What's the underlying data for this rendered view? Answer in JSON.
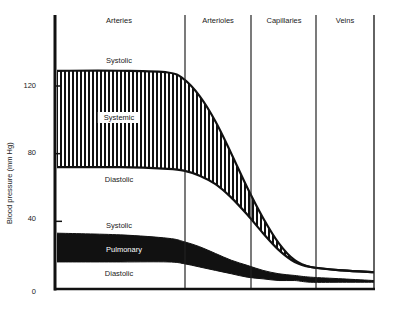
{
  "chart_data": {
    "type": "area",
    "title": "",
    "xlabel": "",
    "ylabel": "Blood pressure (mm Hg)",
    "ylim": [
      0,
      150
    ],
    "yticks": [
      0,
      40,
      80,
      120
    ],
    "grid": false,
    "legend": null,
    "regions": [
      "Arteries",
      "Arterioles",
      "Capillaries",
      "Veins"
    ],
    "x": [
      0,
      0.2,
      0.35,
      0.4,
      0.45,
      0.5,
      0.55,
      0.6,
      0.65,
      0.7,
      0.75,
      0.8,
      0.9,
      1.0
    ],
    "series": [
      {
        "name": "Systemic",
        "fill": "vertical-hatch",
        "upper_label": "Systolic",
        "lower_label": "Diastolic",
        "upper": [
          129,
          129,
          128,
          124,
          114,
          99,
          80,
          60,
          42,
          27,
          17,
          13,
          11,
          10
        ],
        "lower": [
          72,
          72,
          71,
          70,
          67,
          62,
          54,
          44,
          33,
          23,
          16,
          13,
          11,
          10
        ]
      },
      {
        "name": "Pulmonary",
        "fill": "solid-black",
        "upper_label": "Systolic",
        "lower_label": "Diastolic",
        "upper": [
          33,
          32,
          30,
          28,
          25,
          21,
          17,
          14,
          11,
          9,
          8,
          7,
          6,
          5
        ],
        "lower": [
          16,
          16,
          16,
          15,
          13,
          11,
          9,
          7,
          6,
          5,
          5,
          4,
          4,
          4
        ]
      }
    ],
    "annotations": [
      {
        "text": "Systolic",
        "region": "Arteries",
        "near": "systemic upper",
        "value": 133
      },
      {
        "text": "Systemic",
        "region": "Arteries",
        "inside": "systemic band",
        "value": 100
      },
      {
        "text": "Diastolic",
        "region": "Arteries",
        "near": "systemic lower",
        "value": 62
      },
      {
        "text": "Systolic",
        "region": "Arteries",
        "near": "pulmonary upper",
        "value": 37
      },
      {
        "text": "Pulmonary",
        "region": "Arteries",
        "inside": "pulmonary band",
        "value": 24
      },
      {
        "text": "Diastolic",
        "region": "Arteries",
        "near": "pulmonary lower",
        "value": 9
      }
    ]
  },
  "labels": {
    "ylabel": "Blood pressure (mm Hg)",
    "regions": [
      "Arteries",
      "Arterioles",
      "Capillaries",
      "Veins"
    ],
    "ticks": [
      "120",
      "80",
      "40",
      "0"
    ],
    "systemic_systolic": "Systolic",
    "systemic": "Systemic",
    "systemic_diastolic": "Diastolic",
    "pulmonary_systolic": "Systolic",
    "pulmonary": "Pulmonary",
    "pulmonary_diastolic": "Diastolic"
  }
}
